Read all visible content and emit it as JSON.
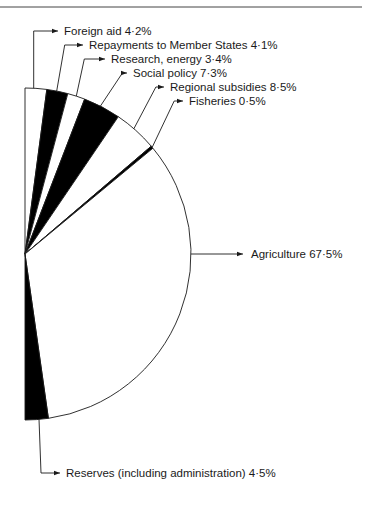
{
  "chart_data": {
    "type": "pie",
    "variant": "semicircle",
    "title": "",
    "unit": "%",
    "categories": [
      "Foreign aid",
      "Repayments to Member States",
      "Research, energy",
      "Social policy",
      "Regional subsidies",
      "Fisheries",
      "Agriculture",
      "Reserves (including administration)"
    ],
    "values": [
      4.2,
      4.1,
      3.4,
      7.3,
      8.5,
      0.5,
      67.5,
      4.5
    ],
    "fills": [
      "#ffffff",
      "#000000",
      "#ffffff",
      "#000000",
      "#ffffff",
      "#000000",
      "#ffffff",
      "#000000"
    ],
    "labels": [
      "Foreign aid 4·2%",
      "Repayments to Member States 4·1%",
      "Research, energy 3·4%",
      "Social policy 7·3%",
      "Regional subsidies 8·5%",
      "Fisheries 0·5%",
      "Agriculture 67·5%",
      "Reserves (including administration) 4·5%"
    ],
    "legend": "none (leader-line labels)",
    "grid": false
  },
  "colors": {
    "ink": "#1a1a1a",
    "paper": "#ffffff",
    "dark_slice": "#000000"
  }
}
